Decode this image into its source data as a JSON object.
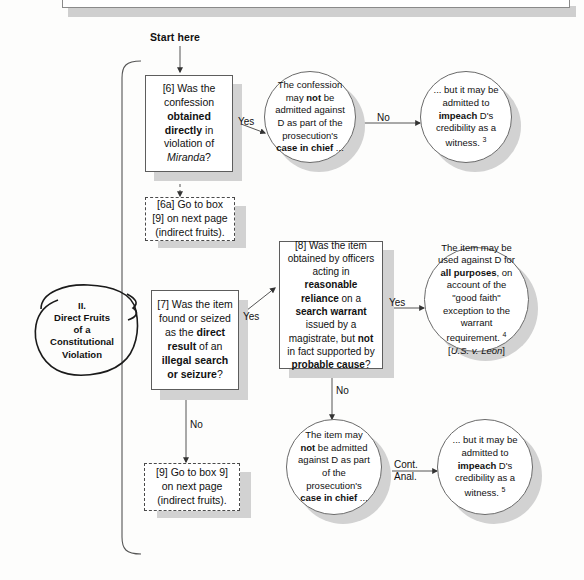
{
  "document": {
    "title": "Direct Fruits of a Constitutional Violation flowchart",
    "start_label": "Start here"
  },
  "annotation": {
    "numeral": "II.",
    "line1": "Direct Fruits",
    "line2": "of a",
    "line3": "Constitutional",
    "line4": "Violation"
  },
  "nodes": {
    "box6": {
      "id": "[6]",
      "text_html": "[6] Was the confession <b>obtained directly</b> in violation of <i>Miranda</i>?",
      "plain": "[6] Was the confession obtained directly in violation of Miranda?"
    },
    "box6a": {
      "id": "[6a]",
      "text_html": "[6a] Go to box [9] on next page (indirect fruits).",
      "plain": "[6a] Go to box [9] on next page (indirect fruits)."
    },
    "box7": {
      "id": "[7]",
      "text_html": "[7] Was the item found or seized as the <b>direct result</b> of an <b>illegal search or seizure</b>?",
      "plain": "[7] Was the item found or seized as the direct result of an illegal search or seizure?"
    },
    "box8": {
      "id": "[8]",
      "text_html": "[8] Was the item obtained by officers acting in <b>reasonable reliance</b> on a <b>search warrant</b> issued by a magistrate, but <b>not</b> in fact supported by <b>probable cause</b>?",
      "plain": "[8] Was the item obtained by officers acting in reasonable reliance on a search warrant issued by a magistrate, but not in fact supported by probable cause?"
    },
    "box9": {
      "id": "[9]",
      "text_html": "[9] Go to box 9] on next page (indirect fruits).",
      "plain": "[9] Go to box 9] on next page (indirect fruits)."
    },
    "circle_confession": {
      "text_html": "The confession may <b>not</b> be admitted against D as part of the prosecution's <b>case in chief</b> ...",
      "plain": "The confession may not be admitted against D as part of the prosecution's case in chief ..."
    },
    "circle_impeach_confession": {
      "text_html": "... but it may be admitted to <b>impeach</b> D's credibility as a witness. <sup>3</sup>",
      "plain": "... but it may be admitted to impeach D's credibility as a witness.",
      "footnote": "3"
    },
    "circle_leon": {
      "text_html": "The item may be used against D for <b>all purposes</b>, on account of the \"good faith\" exception to the warrant requirement. <sup>4</sup><br>[<i>U.S. v. Leon</i>]",
      "plain": "The item may be used against D for all purposes, on account of the \"good faith\" exception to the warrant requirement. [U.S. v. Leon]",
      "footnote": "4",
      "citation": "[U.S. v. Leon]"
    },
    "circle_item_excluded": {
      "text_html": "The item may <b>not</b> be admitted against D as part of the prosecution's <b>case in chief</b> ...",
      "plain": "The item may not be admitted against D as part of the prosecution's case in chief ..."
    },
    "circle_impeach_item": {
      "text_html": "... but it may be admitted to <b>impeach</b> D's credibility as a witness. <sup>5</sup>",
      "plain": "... but it may be admitted to impeach D's credibility as a witness.",
      "footnote": "5"
    }
  },
  "edge_labels": {
    "box6_yes": "Yes",
    "confession_no": "No",
    "box7_yes": "Yes",
    "box7_no": "No",
    "box8_yes": "Yes",
    "box8_no": "No",
    "cont_anal_line1": "Cont.",
    "cont_anal_line2": "Anal."
  },
  "colors": {
    "page_background": "#fdfdfc",
    "node_fill": "#ffffff",
    "node_border": "#5d5d5d",
    "drop_shadow": "#d2d2d2",
    "text": "#111111",
    "connector": "#555555"
  }
}
